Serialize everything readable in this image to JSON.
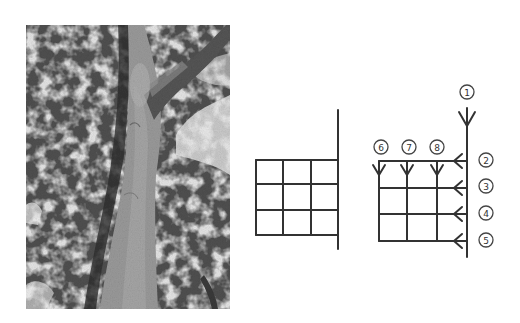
{
  "figure": {
    "photo": {
      "subject": "tree trunk viewed from below, grayscale photograph"
    },
    "middle_diagram": {
      "description": "3x3 grid attached to a vertical trunk line",
      "rows": 3,
      "cols": 3
    },
    "right_diagram": {
      "description": "3x3 grid with numbered flow arrows",
      "labels": {
        "trunk_down": "1",
        "row_arrows": [
          "2",
          "3",
          "4",
          "5"
        ],
        "col_arrows": [
          "6",
          "7",
          "8"
        ]
      }
    }
  },
  "colors": {
    "line": "#333333",
    "background": "#ffffff"
  }
}
